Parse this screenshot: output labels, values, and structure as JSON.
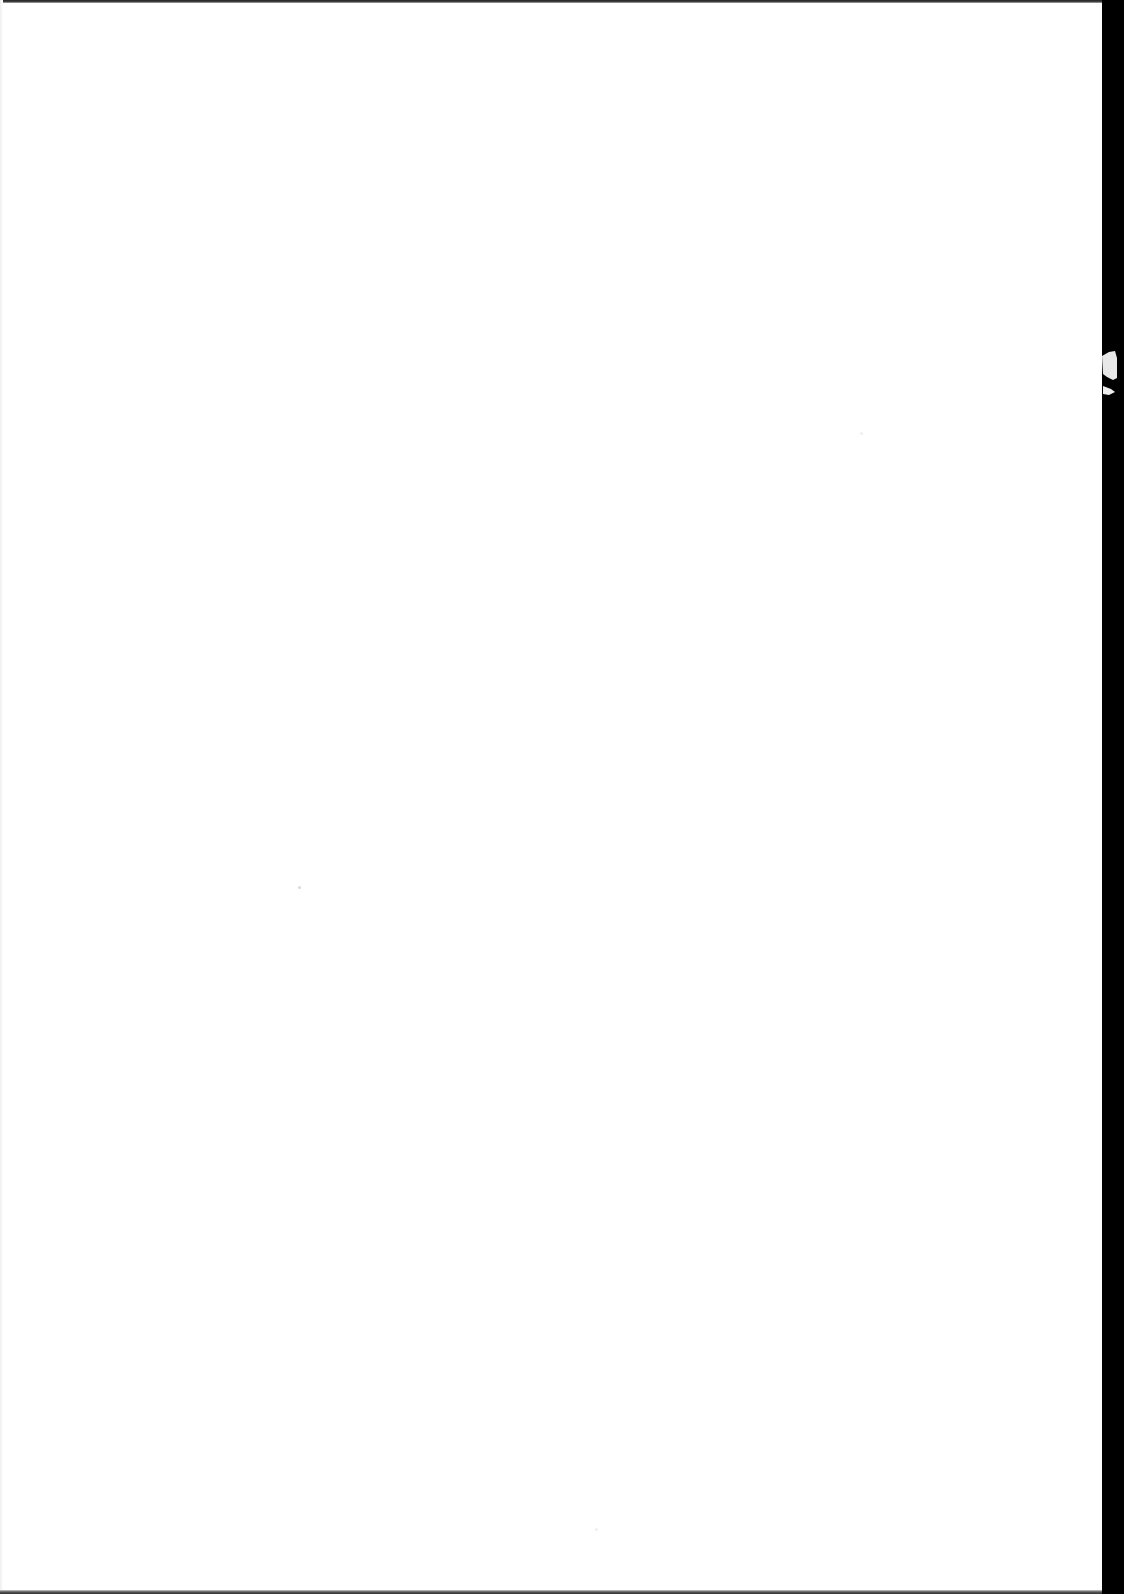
{
  "document": {
    "type": "blank scanned page",
    "text": "",
    "colors": {
      "paper": "#ffffff",
      "border": "#000000"
    }
  }
}
